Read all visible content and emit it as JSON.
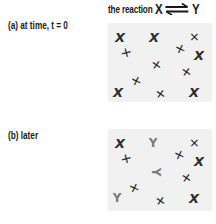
{
  "title": {
    "prefix": "the reaction",
    "reactant": "X",
    "product": "Y",
    "arrow": "equilibrium-arrows"
  },
  "panels": [
    {
      "label": "(a)  at time, t = 0",
      "top": 23,
      "height": 79,
      "molecules": [
        {
          "species": "X",
          "glyph": "X",
          "x": 12,
          "y": 14,
          "rot": 0
        },
        {
          "species": "X",
          "glyph": "X",
          "x": 46,
          "y": 14,
          "rot": 0
        },
        {
          "species": "X",
          "glyph": "✕",
          "x": 86,
          "y": 14,
          "rot": 90
        },
        {
          "species": "X",
          "glyph": "✕",
          "x": 18,
          "y": 30,
          "rot": 30
        },
        {
          "species": "X",
          "glyph": "✕",
          "x": 72,
          "y": 26,
          "rot": 70
        },
        {
          "species": "X",
          "glyph": "X",
          "x": 91,
          "y": 32,
          "rot": 0
        },
        {
          "species": "X",
          "glyph": "✕",
          "x": 48,
          "y": 42,
          "rot": 80
        },
        {
          "species": "X",
          "glyph": "✕",
          "x": 78,
          "y": 49,
          "rot": 80
        },
        {
          "species": "X",
          "glyph": "✕",
          "x": 28,
          "y": 58,
          "rot": 70
        },
        {
          "species": "X",
          "glyph": "X",
          "x": 10,
          "y": 69,
          "rot": 0
        },
        {
          "species": "X",
          "glyph": "✕",
          "x": 52,
          "y": 71,
          "rot": 80
        },
        {
          "species": "X",
          "glyph": "X",
          "x": 86,
          "y": 69,
          "rot": 0
        }
      ]
    },
    {
      "label": "(b)  later",
      "top": 129,
      "height": 82,
      "molecules": [
        {
          "species": "X",
          "glyph": "X",
          "x": 12,
          "y": 14,
          "rot": 0
        },
        {
          "species": "Y",
          "glyph": "Y",
          "x": 45,
          "y": 14,
          "rot": 0
        },
        {
          "species": "X",
          "glyph": "✕",
          "x": 86,
          "y": 14,
          "rot": 90
        },
        {
          "species": "X",
          "glyph": "✕",
          "x": 18,
          "y": 30,
          "rot": 30
        },
        {
          "species": "X",
          "glyph": "✕",
          "x": 71,
          "y": 26,
          "rot": 70
        },
        {
          "species": "X",
          "glyph": "X",
          "x": 91,
          "y": 32,
          "rot": 0
        },
        {
          "species": "Y",
          "glyph": "Y",
          "x": 48,
          "y": 43,
          "rot": 90
        },
        {
          "species": "X",
          "glyph": "✕",
          "x": 78,
          "y": 49,
          "rot": 80
        },
        {
          "species": "X",
          "glyph": "✕",
          "x": 26,
          "y": 59,
          "rot": 70
        },
        {
          "species": "Y",
          "glyph": "Y",
          "x": 9,
          "y": 69,
          "rot": 0
        },
        {
          "species": "X",
          "glyph": "✕",
          "x": 52,
          "y": 72,
          "rot": 80
        },
        {
          "species": "X",
          "glyph": "X",
          "x": 86,
          "y": 69,
          "rot": 0
        }
      ]
    }
  ],
  "colors": {
    "panel_bg": "#f1f1f1",
    "species_x": "#2d2d2d",
    "species_y": "#7a7a7a",
    "text": "#1a1a1a"
  }
}
